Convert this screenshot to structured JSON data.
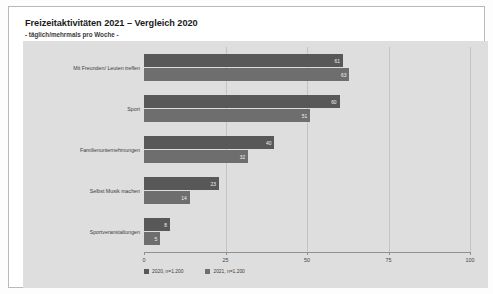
{
  "header": {
    "title": "Freizeitaktivitäten 2021 – Vergleich 2020",
    "subtitle": "- täglich/mehrmals pro Woche -"
  },
  "chart_data": {
    "type": "bar",
    "orientation": "horizontal",
    "title": "Freizeitaktivitäten 2021 – Vergleich 2020",
    "subtitle": "- täglich/mehrmals pro Woche -",
    "xlabel": "",
    "ylabel": "",
    "xlim": [
      0,
      100
    ],
    "xticks": [
      "0",
      "25",
      "50",
      "75",
      "100"
    ],
    "xtick_values": [
      0,
      25,
      50,
      75,
      100
    ],
    "grid": true,
    "legend_position": "bottom-left",
    "categories": [
      "Mit Freunden/ Leuten treffen",
      "Sport",
      "Familienunternehmungen",
      "Selbst Musik machen",
      "Sportveranstaltungen"
    ],
    "series": [
      {
        "name": "2020, n=1.200",
        "color": "#585858",
        "values": [
          61,
          60,
          40,
          23,
          8
        ],
        "labels": [
          "61",
          "60",
          "40",
          "23",
          "8"
        ]
      },
      {
        "name": "2021, n=1.200",
        "color": "#6e6e6e",
        "values": [
          63,
          51,
          32,
          14,
          5
        ],
        "labels": [
          "63",
          "51",
          "32",
          "14",
          "5"
        ]
      }
    ]
  },
  "legend": [
    {
      "label": "2020, n=1.200",
      "color": "#585858"
    },
    {
      "label": "2021, n=1.200",
      "color": "#6e6e6e"
    }
  ]
}
